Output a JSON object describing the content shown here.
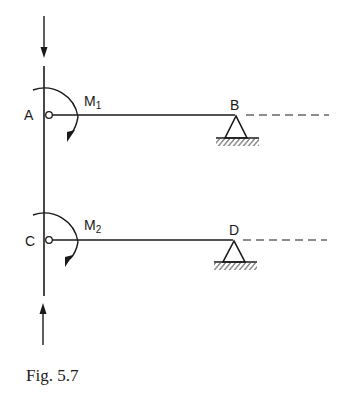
{
  "figure": {
    "caption": "Fig. 5.7",
    "nodes": {
      "A": "A",
      "B": "B",
      "C": "C",
      "D": "D"
    },
    "moments": [
      {
        "name": "M",
        "subscript": "1",
        "at": "A",
        "direction": "clockwise"
      },
      {
        "name": "M",
        "subscript": "2",
        "at": "C",
        "direction": "clockwise"
      }
    ],
    "loads": [
      {
        "name": "top-axial-load",
        "direction": "down"
      },
      {
        "name": "bottom-axial-load",
        "direction": "up"
      }
    ],
    "supports": [
      {
        "at": "B",
        "type": "pinned"
      },
      {
        "at": "D",
        "type": "pinned"
      }
    ]
  }
}
